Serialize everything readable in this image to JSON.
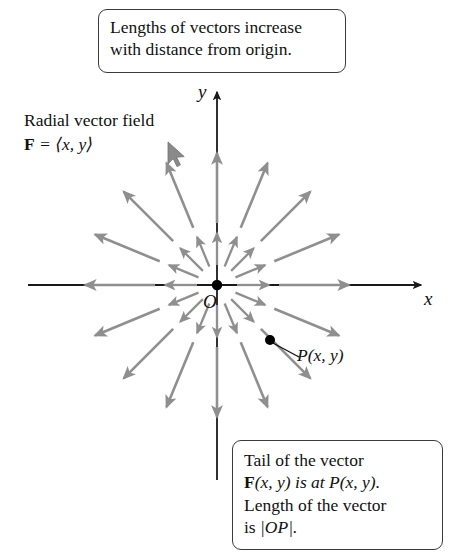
{
  "figure": {
    "title_note": "Radial vector field",
    "formula_bold": "F",
    "formula_rest": " = ⟨x, y⟩",
    "origin_label": "O",
    "x_axis_label": "x",
    "y_axis_label": "y",
    "point_label": "P(x, y)"
  },
  "callouts": {
    "top": {
      "line1": "Lengths of vectors increase",
      "line2": "with distance from origin."
    },
    "bottom": {
      "line1": "Tail of the vector",
      "line2_bold": "F",
      "line2_rest": "(x, y) is at ",
      "line2_point": "P(x, y).",
      "line3": "Length of the vector",
      "line4_pre": "is ",
      "line4_abs": "|OP|."
    }
  },
  "colors": {
    "vector_gray": "#8f8f8f",
    "axis_black": "#1a1a1a",
    "box_border": "#3b3b3b",
    "page_background": "#ffffff"
  },
  "chart_data": {
    "type": "scatter",
    "xlabel": "x",
    "ylabel": "y",
    "origin_px": [
      217,
      285
    ],
    "x_axis_extent_px": [
      28,
      425
    ],
    "y_axis_extent_px": [
      88,
      480
    ],
    "point_P_px": [
      270,
      340
    ],
    "angles_deg": [
      0,
      22.5,
      45,
      67.5,
      90,
      112.5,
      135,
      157.5,
      180,
      202.5,
      225,
      247.5,
      270,
      292.5,
      315,
      337.5
    ],
    "rings": [
      {
        "name": "inner",
        "tail_radius_px": 20,
        "head_radius_px": 52
      },
      {
        "name": "outer",
        "tail_radius_px": 62,
        "head_radius_px": 132
      }
    ]
  }
}
